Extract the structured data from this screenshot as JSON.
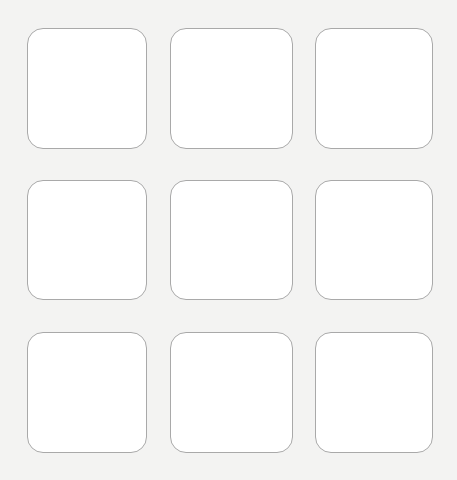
{
  "canvas": {
    "width": 457,
    "height": 480,
    "background": "#f3f3f2"
  },
  "tile_style": {
    "fill": "#ffffff",
    "border": "#a9a9a9",
    "radius": 16
  },
  "grid": {
    "rows": 3,
    "columns": 3,
    "tiles": [
      {
        "row": 1,
        "col": 1,
        "x": 27,
        "y": 28,
        "w": 120,
        "h": 121,
        "label": ""
      },
      {
        "row": 1,
        "col": 2,
        "x": 170,
        "y": 28,
        "w": 123,
        "h": 121,
        "label": ""
      },
      {
        "row": 1,
        "col": 3,
        "x": 315,
        "y": 28,
        "w": 118,
        "h": 121,
        "label": ""
      },
      {
        "row": 2,
        "col": 1,
        "x": 27,
        "y": 180,
        "w": 120,
        "h": 120,
        "label": ""
      },
      {
        "row": 2,
        "col": 2,
        "x": 170,
        "y": 180,
        "w": 123,
        "h": 120,
        "label": ""
      },
      {
        "row": 2,
        "col": 3,
        "x": 315,
        "y": 180,
        "w": 118,
        "h": 120,
        "label": ""
      },
      {
        "row": 3,
        "col": 1,
        "x": 27,
        "y": 332,
        "w": 120,
        "h": 121,
        "label": ""
      },
      {
        "row": 3,
        "col": 2,
        "x": 170,
        "y": 332,
        "w": 123,
        "h": 121,
        "label": ""
      },
      {
        "row": 3,
        "col": 3,
        "x": 315,
        "y": 332,
        "w": 118,
        "h": 121,
        "label": ""
      }
    ]
  }
}
